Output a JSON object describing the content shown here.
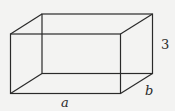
{
  "diagram": {
    "type": "rectangular-prism",
    "labels": {
      "height": "3",
      "depth": "b",
      "width": "a"
    },
    "colors": {
      "stroke": "#2a2a2a",
      "background": "#f3f3f2"
    }
  }
}
